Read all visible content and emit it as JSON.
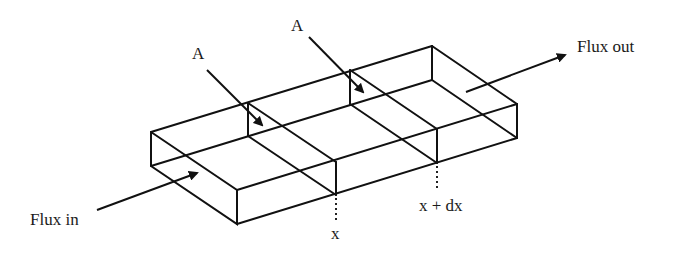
{
  "diagram": {
    "type": "flux-control-volume",
    "labels": {
      "flux_in": "Flux in",
      "flux_out": "Flux out",
      "area_left": "A",
      "area_right": "A",
      "position_x": "x",
      "position_x_dx": "x + dx"
    },
    "colors": {
      "line": "#111111",
      "text": "#1a1a1a",
      "background": "#ffffff"
    }
  }
}
